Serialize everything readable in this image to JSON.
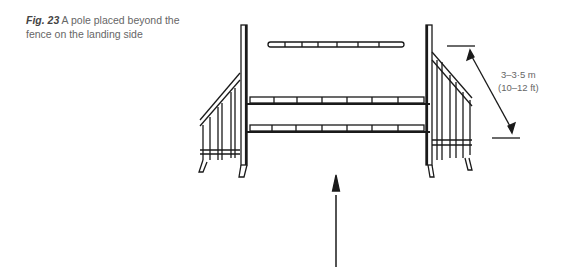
{
  "figure": {
    "label": "Fig. 23",
    "caption": "A pole placed beyond the fence on the landing side"
  },
  "measurement": {
    "metric": "3–3·5 m",
    "imperial": "(10–12 ft)"
  },
  "icons": {
    "direction_arrow": "up-arrow-icon",
    "dimension_arrow": "double-headed-arrow-icon"
  },
  "colors": {
    "line": "#1a1a1a",
    "text": "#666666"
  }
}
